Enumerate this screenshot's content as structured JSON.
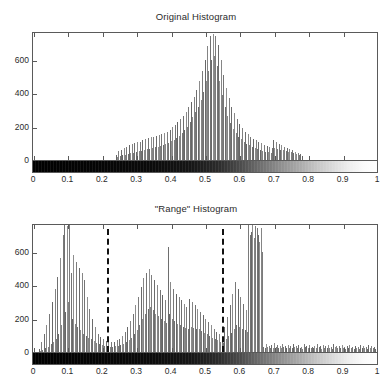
{
  "figure": {
    "background_color": "#ffffff",
    "axis_color": "#5a5a5a",
    "bar_color": "#767676",
    "dash_color": "#111111"
  },
  "panels": [
    {
      "id": "original",
      "title": "Original Histogram",
      "colorbar": {
        "name": "grayscale-colorbar",
        "from": "#000000",
        "to": "#ffffff"
      }
    },
    {
      "id": "range",
      "title": "\"Range\" Histogram",
      "colorbar": {
        "name": "grayscale-colorbar",
        "from": "#000000",
        "to": "#ffffff"
      }
    }
  ],
  "axis": {
    "x_ticks": [
      "0",
      "0.1",
      "0.2",
      "0.3",
      "0.4",
      "0.5",
      "0.6",
      "0.7",
      "0.8",
      "0.9",
      "1"
    ],
    "x_tick_values": [
      0,
      0.1,
      0.2,
      0.3,
      0.4,
      0.5,
      0.6,
      0.7,
      0.8,
      0.9,
      1
    ],
    "y_ticks": [
      "0",
      "200",
      "400",
      "600"
    ],
    "y_tick_values": [
      0,
      200,
      400,
      600
    ],
    "xlim": [
      0,
      1
    ],
    "ylim": [
      0,
      760
    ]
  },
  "chart_data": [
    {
      "type": "bar",
      "id": "original-histogram",
      "title": "Original Histogram",
      "xlabel": "",
      "ylabel": "",
      "xlim": [
        0,
        1
      ],
      "ylim": [
        0,
        760
      ],
      "grid": false,
      "legend": null,
      "bin_width": 0.0039,
      "annotations": [],
      "x": [
        0.24,
        0.244,
        0.248,
        0.252,
        0.256,
        0.26,
        0.264,
        0.268,
        0.271,
        0.275,
        0.279,
        0.283,
        0.287,
        0.291,
        0.295,
        0.299,
        0.303,
        0.307,
        0.311,
        0.315,
        0.318,
        0.322,
        0.326,
        0.33,
        0.334,
        0.338,
        0.342,
        0.346,
        0.35,
        0.354,
        0.358,
        0.362,
        0.365,
        0.369,
        0.373,
        0.377,
        0.381,
        0.385,
        0.389,
        0.393,
        0.397,
        0.401,
        0.405,
        0.409,
        0.412,
        0.416,
        0.42,
        0.424,
        0.428,
        0.432,
        0.436,
        0.44,
        0.444,
        0.448,
        0.452,
        0.456,
        0.459,
        0.463,
        0.467,
        0.471,
        0.475,
        0.479,
        0.483,
        0.487,
        0.491,
        0.495,
        0.499,
        0.503,
        0.506,
        0.51,
        0.514,
        0.518,
        0.522,
        0.526,
        0.53,
        0.534,
        0.538,
        0.542,
        0.546,
        0.55,
        0.553,
        0.557,
        0.561,
        0.565,
        0.569,
        0.573,
        0.577,
        0.581,
        0.585,
        0.589,
        0.593,
        0.597,
        0.6,
        0.604,
        0.608,
        0.612,
        0.616,
        0.62,
        0.624,
        0.628,
        0.632,
        0.636,
        0.64,
        0.644,
        0.647,
        0.651,
        0.655,
        0.659,
        0.663,
        0.667,
        0.671,
        0.675,
        0.679,
        0.683,
        0.687,
        0.691,
        0.694,
        0.698,
        0.702,
        0.706,
        0.71,
        0.714,
        0.718,
        0.722,
        0.726,
        0.73,
        0.734,
        0.738,
        0.741,
        0.745,
        0.749,
        0.753,
        0.757,
        0.761,
        0.765,
        0.769,
        0.773,
        0.777,
        0.781
      ],
      "values": [
        30,
        18,
        55,
        22,
        60,
        28,
        70,
        32,
        80,
        36,
        88,
        40,
        95,
        44,
        100,
        48,
        105,
        52,
        110,
        56,
        118,
        60,
        125,
        64,
        130,
        68,
        135,
        72,
        140,
        76,
        145,
        80,
        150,
        86,
        155,
        92,
        160,
        98,
        170,
        104,
        180,
        112,
        195,
        120,
        210,
        130,
        225,
        145,
        245,
        160,
        265,
        180,
        290,
        200,
        315,
        225,
        345,
        255,
        380,
        285,
        420,
        320,
        470,
        360,
        530,
        410,
        600,
        470,
        680,
        530,
        740,
        600,
        755,
        620,
        745,
        560,
        690,
        470,
        600,
        390,
        510,
        320,
        430,
        265,
        370,
        220,
        320,
        185,
        280,
        160,
        245,
        140,
        215,
        125,
        190,
        110,
        170,
        98,
        155,
        88,
        140,
        80,
        128,
        72,
        118,
        66,
        108,
        60,
        100,
        55,
        92,
        50,
        86,
        46,
        80,
        42,
        74,
        120,
        70,
        105,
        66,
        95,
        62,
        88,
        58,
        80,
        54,
        72,
        50,
        66,
        46,
        58,
        42,
        50,
        36,
        42,
        30,
        34,
        24,
        26
      ]
    },
    {
      "type": "bar",
      "id": "range-histogram",
      "title": "\"Range\" Histogram",
      "xlabel": "",
      "ylabel": "",
      "xlim": [
        0,
        1
      ],
      "ylim": [
        0,
        760
      ],
      "grid": false,
      "legend": null,
      "bin_width": 0.0039,
      "annotations": [
        {
          "type": "vline",
          "style": "dashed",
          "x": 0.215,
          "color": "#111111"
        },
        {
          "type": "vline",
          "style": "dashed",
          "x": 0.55,
          "color": "#111111"
        }
      ],
      "x": [
        0.016,
        0.02,
        0.023,
        0.027,
        0.031,
        0.035,
        0.039,
        0.043,
        0.047,
        0.051,
        0.055,
        0.059,
        0.063,
        0.066,
        0.07,
        0.074,
        0.078,
        0.082,
        0.086,
        0.09,
        0.094,
        0.098,
        0.102,
        0.106,
        0.109,
        0.113,
        0.117,
        0.121,
        0.125,
        0.129,
        0.133,
        0.137,
        0.141,
        0.145,
        0.149,
        0.153,
        0.156,
        0.16,
        0.164,
        0.168,
        0.172,
        0.176,
        0.18,
        0.184,
        0.188,
        0.192,
        0.196,
        0.2,
        0.203,
        0.207,
        0.211,
        0.215,
        0.219,
        0.223,
        0.227,
        0.231,
        0.235,
        0.239,
        0.243,
        0.247,
        0.25,
        0.254,
        0.258,
        0.262,
        0.266,
        0.27,
        0.274,
        0.278,
        0.282,
        0.286,
        0.29,
        0.294,
        0.297,
        0.301,
        0.305,
        0.309,
        0.313,
        0.317,
        0.321,
        0.325,
        0.329,
        0.333,
        0.337,
        0.341,
        0.344,
        0.348,
        0.352,
        0.356,
        0.36,
        0.364,
        0.368,
        0.372,
        0.376,
        0.38,
        0.384,
        0.388,
        0.391,
        0.395,
        0.399,
        0.403,
        0.407,
        0.411,
        0.415,
        0.419,
        0.423,
        0.427,
        0.431,
        0.435,
        0.438,
        0.442,
        0.446,
        0.45,
        0.454,
        0.458,
        0.462,
        0.466,
        0.47,
        0.474,
        0.478,
        0.482,
        0.485,
        0.489,
        0.493,
        0.497,
        0.501,
        0.505,
        0.509,
        0.513,
        0.517,
        0.521,
        0.525,
        0.529,
        0.532,
        0.536,
        0.54,
        0.544,
        0.548,
        0.552,
        0.556,
        0.56,
        0.564,
        0.568,
        0.572,
        0.576,
        0.579,
        0.583,
        0.587,
        0.591,
        0.595,
        0.599,
        0.603,
        0.607,
        0.611,
        0.615,
        0.619,
        0.623,
        0.626,
        0.63,
        0.634,
        0.638,
        0.642,
        0.646,
        0.65,
        0.654,
        0.658,
        0.662,
        0.666,
        0.67,
        0.673,
        0.677,
        0.681,
        0.685,
        0.689,
        0.693,
        0.697,
        0.701,
        0.705,
        0.709,
        0.713,
        0.717,
        0.72,
        0.724,
        0.728,
        0.732,
        0.736,
        0.74,
        0.744,
        0.748,
        0.752,
        0.756,
        0.76,
        0.764,
        0.767,
        0.771,
        0.775,
        0.779,
        0.783,
        0.787,
        0.791,
        0.795,
        0.799,
        0.803,
        0.807,
        0.811,
        0.814,
        0.818,
        0.822,
        0.826,
        0.83,
        0.834,
        0.838,
        0.842,
        0.846,
        0.85,
        0.854,
        0.858,
        0.861,
        0.865,
        0.869,
        0.873,
        0.877,
        0.881,
        0.885,
        0.889,
        0.893,
        0.897,
        0.901,
        0.905,
        0.908,
        0.912,
        0.916,
        0.92,
        0.924,
        0.928,
        0.932,
        0.936,
        0.94,
        0.944,
        0.948,
        0.952,
        0.955,
        0.959,
        0.963,
        0.967,
        0.971,
        0.975,
        0.979,
        0.983,
        0.987,
        0.991,
        0.995,
        0.999
      ],
      "values": [
        20,
        8,
        60,
        14,
        110,
        22,
        160,
        30,
        230,
        45,
        300,
        60,
        380,
        80,
        450,
        110,
        560,
        160,
        700,
        760,
        240,
        755,
        300,
        760,
        470,
        200,
        580,
        170,
        540,
        150,
        500,
        130,
        470,
        110,
        430,
        95,
        330,
        85,
        260,
        75,
        200,
        65,
        150,
        55,
        110,
        48,
        90,
        42,
        75,
        38,
        65,
        35,
        60,
        32,
        58,
        30,
        62,
        34,
        70,
        38,
        80,
        42,
        95,
        50,
        120,
        58,
        150,
        70,
        185,
        85,
        230,
        105,
        280,
        130,
        330,
        160,
        390,
        195,
        440,
        230,
        470,
        255,
        495,
        270,
        460,
        250,
        430,
        230,
        400,
        215,
        370,
        200,
        340,
        185,
        310,
        175,
        630,
        230,
        420,
        200,
        380,
        185,
        350,
        170,
        330,
        160,
        310,
        150,
        290,
        145,
        270,
        140,
        320,
        150,
        300,
        145,
        280,
        140,
        260,
        135,
        240,
        125,
        220,
        115,
        200,
        105,
        180,
        95,
        160,
        85,
        140,
        78,
        120,
        70,
        105,
        62,
        90,
        55,
        150,
        75,
        210,
        95,
        280,
        115,
        350,
        140,
        420,
        160,
        380,
        150,
        330,
        140,
        290,
        130,
        250,
        120,
        760,
        700,
        720,
        760,
        680,
        755,
        740,
        700,
        660,
        740,
        600,
        30,
        25,
        45,
        28,
        38,
        22,
        40,
        25,
        55,
        30,
        42,
        26,
        35,
        24,
        50,
        28,
        38,
        22,
        44,
        26,
        36,
        24,
        48,
        28,
        34,
        22,
        40,
        26,
        30,
        20,
        46,
        28,
        36,
        24,
        42,
        26,
        32,
        22,
        38,
        24,
        50,
        30,
        34,
        20,
        44,
        26,
        36,
        24,
        40,
        22,
        32,
        20,
        46,
        28,
        38,
        24,
        34,
        22,
        42,
        26,
        30,
        18,
        36,
        22,
        44,
        26,
        32,
        20,
        38,
        24,
        28,
        18,
        40,
        24,
        34,
        22,
        30,
        20,
        42,
        26,
        36,
        22,
        28,
        18,
        34,
        20,
        170
      ]
    }
  ]
}
